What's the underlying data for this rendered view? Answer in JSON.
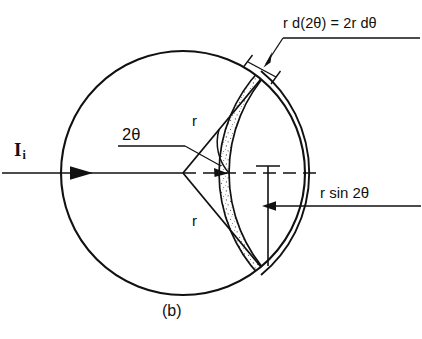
{
  "figure": {
    "caption": "(b)",
    "background_color": "#ffffff",
    "stroke_color": "#111111",
    "stipple_color": "#555555",
    "labels": {
      "incident_beam": "I",
      "incident_beam_subscript": "i",
      "angle": "2θ",
      "radius_upper": "r",
      "radius_lower": "r",
      "arc_width_dimension": "r d(2θ) = 2r dθ",
      "vertical_dimension": "r sin 2θ"
    },
    "geometry": {
      "circle_center_x": 183,
      "circle_center_y": 173,
      "circle_radius": 122,
      "two_theta_degrees": 50,
      "band_thickness": 9,
      "beam_arrow_tip_x": 92,
      "beam_axis_y": 173
    }
  }
}
